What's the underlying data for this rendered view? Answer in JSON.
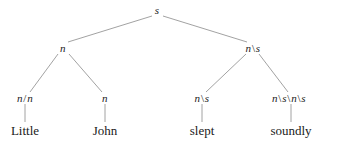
{
  "figure": {
    "kind": "categorial-grammar-syntax-tree",
    "sentence": "Little John slept soundly",
    "background_color": "#ffffff",
    "edge_color": "#8a8a8a",
    "text_color": "#1a1a1a"
  },
  "nodes": {
    "root": {
      "label": "s",
      "x": 157,
      "y": 10
    },
    "np": {
      "label": "n",
      "x": 63,
      "y": 48
    },
    "vp": {
      "label": "n\\s",
      "x": 253,
      "y": 48
    },
    "adj": {
      "label": "n/n",
      "x": 25,
      "y": 98
    },
    "noun": {
      "label": "n",
      "x": 105,
      "y": 98
    },
    "verb_cat": {
      "label": "n\\s",
      "x": 202,
      "y": 98
    },
    "adverb_cat": {
      "label": "n\\s\\n\\s",
      "x": 289,
      "y": 98
    },
    "word_little": {
      "label": "Little",
      "x": 25,
      "y": 130
    },
    "word_john": {
      "label": "John",
      "x": 105,
      "y": 130
    },
    "word_slept": {
      "label": "slept",
      "x": 202,
      "y": 130
    },
    "word_soundly": {
      "label": "soundly",
      "x": 291,
      "y": 130
    }
  },
  "edges": [
    {
      "name": "root-to-np",
      "x1": 152,
      "y1": 16,
      "x2": 68,
      "y2": 42
    },
    {
      "name": "root-to-vp",
      "x1": 163,
      "y1": 16,
      "x2": 247,
      "y2": 42
    },
    {
      "name": "np-to-adj",
      "x1": 58,
      "y1": 54,
      "x2": 30,
      "y2": 92
    },
    {
      "name": "np-to-noun",
      "x1": 69,
      "y1": 54,
      "x2": 102,
      "y2": 92
    },
    {
      "name": "vp-to-verb",
      "x1": 246,
      "y1": 54,
      "x2": 206,
      "y2": 92
    },
    {
      "name": "vp-to-adverb",
      "x1": 259,
      "y1": 54,
      "x2": 288,
      "y2": 92
    },
    {
      "name": "adj-to-little",
      "x1": 25,
      "y1": 104,
      "x2": 25,
      "y2": 122
    },
    {
      "name": "noun-to-john",
      "x1": 105,
      "y1": 104,
      "x2": 105,
      "y2": 122
    },
    {
      "name": "verb-to-slept",
      "x1": 202,
      "y1": 104,
      "x2": 202,
      "y2": 122
    },
    {
      "name": "adverb-to-soundly",
      "x1": 291,
      "y1": 104,
      "x2": 291,
      "y2": 122
    }
  ]
}
